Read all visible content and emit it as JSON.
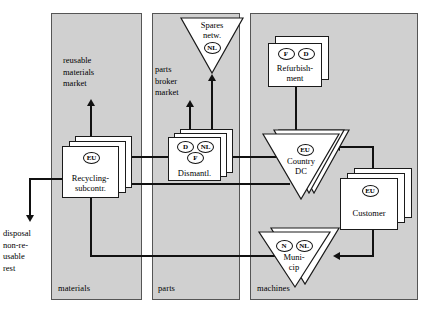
{
  "diagram": {
    "lanes": [
      {
        "id": "materials",
        "label": "materials"
      },
      {
        "id": "parts",
        "label": "parts"
      },
      {
        "id": "machines",
        "label": "machines"
      }
    ],
    "external_labels": [
      {
        "id": "reusable-materials-market",
        "lines": [
          "reusable",
          "materials",
          "market"
        ]
      },
      {
        "id": "parts-broker-market",
        "lines": [
          "parts",
          "broker",
          "market"
        ]
      },
      {
        "id": "disposal-non-reusable-rest",
        "lines": [
          "disposal",
          "non-re-",
          "usable",
          "rest"
        ]
      }
    ],
    "nodes": [
      {
        "id": "spares-network",
        "label_lines": [
          "Spares",
          "netw."
        ],
        "shape": "triangle",
        "stack": 1,
        "codes": [
          "NL"
        ]
      },
      {
        "id": "refurbishment",
        "label_lines": [
          "Refurbish-",
          "ment"
        ],
        "shape": "box",
        "stack": 2,
        "codes": [
          "F",
          "D"
        ]
      },
      {
        "id": "dismantler",
        "label_lines": [
          "Dismantl."
        ],
        "shape": "box",
        "stack": 3,
        "codes": [
          "D",
          "NL",
          "F"
        ]
      },
      {
        "id": "country-dc",
        "label_lines": [
          "Country",
          "DC"
        ],
        "shape": "triangle",
        "stack": 3,
        "codes": [
          "EU"
        ]
      },
      {
        "id": "recycling-subcontractor",
        "label_lines": [
          "Recycling-",
          "subcontr."
        ],
        "shape": "box",
        "stack": 3,
        "codes": [
          "EU"
        ]
      },
      {
        "id": "customer",
        "label_lines": [
          "Customer"
        ],
        "shape": "box",
        "stack": 3,
        "codes": [
          "EU"
        ]
      },
      {
        "id": "municipality",
        "label_lines": [
          "Muni-",
          "cip"
        ],
        "shape": "triangle",
        "stack": 2,
        "codes": [
          "N",
          "NL"
        ]
      }
    ],
    "flows": [
      {
        "from": "customer",
        "to": "country-dc"
      },
      {
        "from": "customer",
        "to": "municipality"
      },
      {
        "from": "country-dc",
        "to": "refurbishment"
      },
      {
        "from": "country-dc",
        "to": "dismantler"
      },
      {
        "from": "country-dc",
        "to": "recycling-subcontractor"
      },
      {
        "from": "dismantler",
        "to": "spares-network"
      },
      {
        "from": "dismantler",
        "to": "parts-broker-market"
      },
      {
        "from": "dismantler",
        "to": "recycling-subcontractor"
      },
      {
        "from": "municipality",
        "to": "recycling-subcontractor"
      },
      {
        "from": "recycling-subcontractor",
        "to": "reusable-materials-market"
      },
      {
        "from": "recycling-subcontractor",
        "to": "disposal-non-reusable-rest"
      }
    ],
    "colors": {
      "lane_fill": "#d0d0d0",
      "lane_stroke": "#555555",
      "node_fill": "#ffffff",
      "node_stroke": "#1a1a1a",
      "connector": "#111111"
    }
  }
}
